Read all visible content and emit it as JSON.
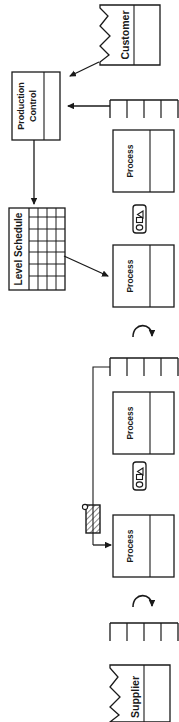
{
  "diagram": {
    "orientation": "rotated-90-ccw",
    "stroke_color": "#1a1a1a",
    "background_color": "#ffffff"
  },
  "nodes": {
    "customer": {
      "label": "Customer",
      "type": "outside-source-box"
    },
    "production_control": {
      "label_line1": "Production",
      "label_line2": "Control",
      "type": "information-box"
    },
    "level_schedule": {
      "label": "Level Schedule",
      "type": "load-leveling-box",
      "grid_columns": 4,
      "grid_rows": 7
    },
    "process_1": {
      "label": "Process",
      "type": "process-box"
    },
    "process_2": {
      "label": "Process",
      "type": "process-box"
    },
    "process_3": {
      "label": "Process",
      "type": "process-box"
    },
    "process_4": {
      "label": "Process",
      "type": "process-box"
    },
    "supplier": {
      "label": "Supplier",
      "type": "outside-source-box"
    }
  },
  "symbols": {
    "supermarket_top": {
      "name": "supermarket",
      "dividers": 3
    },
    "supermarket_mid": {
      "name": "supermarket",
      "dividers": 3
    },
    "supermarket_bottom": {
      "name": "supermarket",
      "dividers": 3
    },
    "kanban_post": {
      "name": "kanban-post"
    },
    "sequenced_pull_1": {
      "name": "sequenced-pull-ball"
    },
    "sequenced_pull_2": {
      "name": "sequenced-pull-ball"
    },
    "physical_pull_1": {
      "name": "physical-pull-arrow"
    },
    "physical_pull_2": {
      "name": "physical-pull-arrow"
    }
  },
  "connections": [
    {
      "name": "customer-to-production-control",
      "type": "information-arrow"
    },
    {
      "name": "supermarket-top-to-production-control",
      "type": "information-arrow"
    },
    {
      "name": "production-control-to-level-schedule",
      "type": "information-arrow"
    },
    {
      "name": "level-schedule-to-process",
      "type": "information-arrow"
    },
    {
      "name": "kanban-post-to-process",
      "type": "kanban-arrow"
    }
  ]
}
